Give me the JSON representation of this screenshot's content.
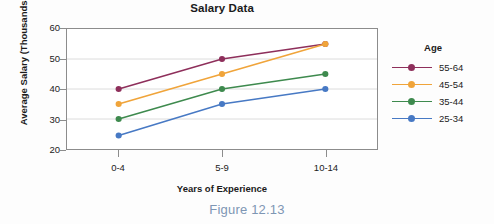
{
  "caption": "Figure 12.13",
  "legend": {
    "title": "Age",
    "position": "right"
  },
  "chart_data": {
    "type": "line",
    "title": "Salary Data",
    "xlabel": "Years of Experience",
    "ylabel": "Average Salary (Thousands of $)",
    "categories": [
      "0-4",
      "5-9",
      "10-14"
    ],
    "ylim": [
      20,
      60
    ],
    "yticks": [
      20,
      30,
      40,
      50,
      60
    ],
    "ytick_labels": [
      "20",
      "30",
      "40",
      "50",
      "60"
    ],
    "grid": true,
    "grid_axis": "y",
    "series": [
      {
        "name": "55-64",
        "values": [
          40,
          50,
          55
        ],
        "color": "#8e2f5b"
      },
      {
        "name": "45-54",
        "values": [
          35,
          45,
          55
        ],
        "color": "#f0a43a"
      },
      {
        "name": "35-44",
        "values": [
          30,
          40,
          45
        ],
        "color": "#3e8a4e"
      },
      {
        "name": "25-34",
        "values": [
          24.5,
          35,
          40
        ],
        "color": "#4779c4"
      }
    ]
  }
}
